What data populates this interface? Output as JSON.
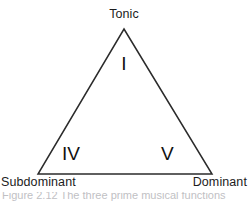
{
  "figure": {
    "type": "triangle-diagram",
    "background_color": "#ffffff",
    "stroke_color": "#2b2b2b",
    "stroke_width": 1.5,
    "text_color": "#1c1c1c"
  },
  "vertices": {
    "top": {
      "label": "Tonic",
      "numeral": "I",
      "x": 124,
      "y": 29
    },
    "bottom_left": {
      "label": "Subdominant",
      "numeral": "IV",
      "x": 38,
      "y": 174
    },
    "bottom_right": {
      "label": "Dominant",
      "numeral": "V",
      "x": 212,
      "y": 174
    }
  },
  "labels": {
    "tonic": "Tonic",
    "subdominant": "Subdominant",
    "dominant": "Dominant"
  },
  "numerals": {
    "tonic": "I",
    "subdominant": "IV",
    "dominant": "V"
  },
  "caption": {
    "text": "Figure 2.12   The three prime musical functions"
  }
}
